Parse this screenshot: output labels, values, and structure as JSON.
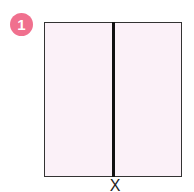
{
  "badge": {
    "number": "1",
    "color": "#f0708e"
  },
  "figure": {
    "type": "square-divided-vertically",
    "fill_color": "#fbf1f8",
    "stroke_color": "#333333",
    "divider_color": "#111111",
    "label_below": "X"
  }
}
